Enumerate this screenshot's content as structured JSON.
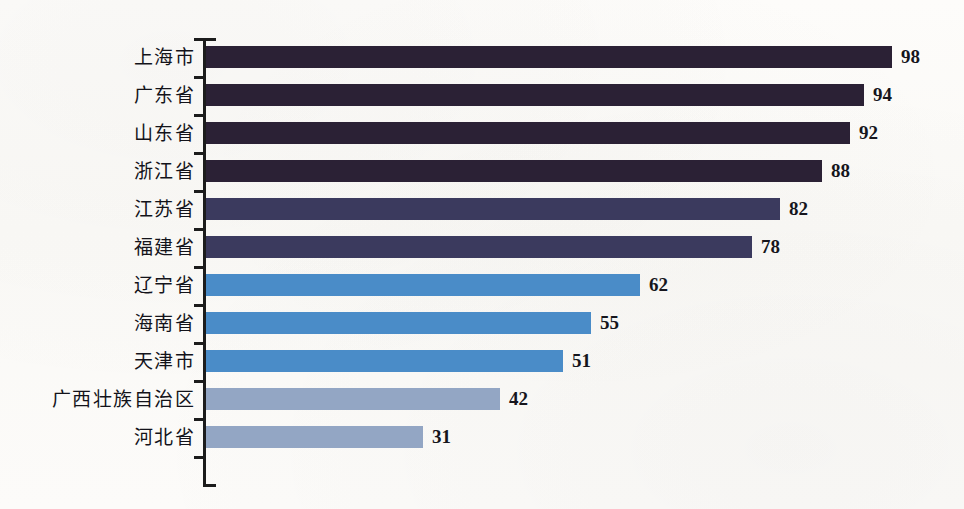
{
  "chart_data": {
    "type": "bar",
    "orientation": "horizontal",
    "title": "",
    "subtitle": "",
    "xlabel": "",
    "ylabel": "",
    "xlim": [
      0,
      100
    ],
    "grid": false,
    "legend": "none",
    "categories": [
      "上海市",
      "广东省",
      "山东省",
      "浙江省",
      "江苏省",
      "福建省",
      "辽宁省",
      "海南省",
      "天津市",
      "广西壮族自治区",
      "河北省"
    ],
    "values": [
      98,
      94,
      92,
      88,
      82,
      78,
      62,
      55,
      51,
      42,
      31
    ],
    "bar_colors": [
      "#2b2135",
      "#2b2135",
      "#2b2135",
      "#2b2135",
      "#3b3a5e",
      "#3b3a5e",
      "#4a8cc8",
      "#4a8cc8",
      "#4a8cc8",
      "#93a6c4",
      "#93a6c4"
    ],
    "axis_color": "#1c1c1c",
    "background_color": "#fdfcfa",
    "value_label_color": "#15151c"
  }
}
